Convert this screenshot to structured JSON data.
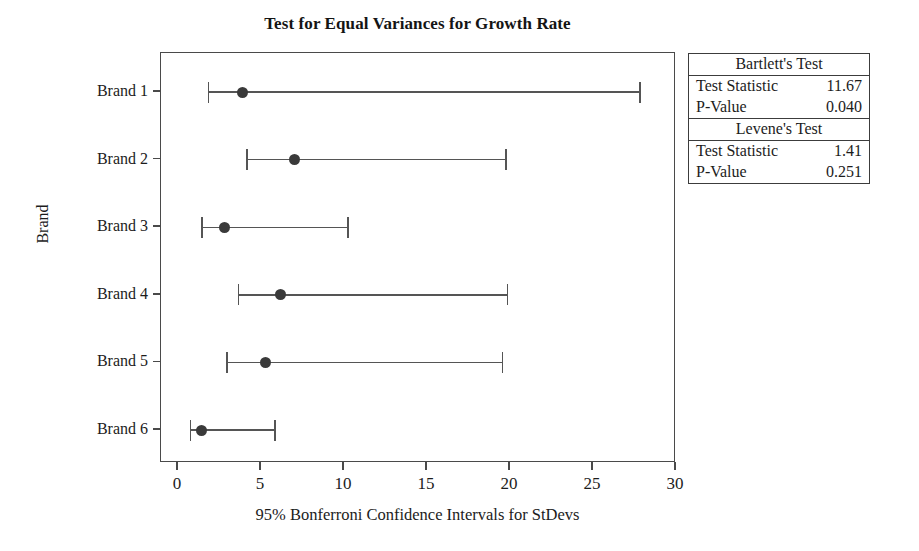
{
  "chart_data": {
    "type": "scatter",
    "title": "Test for Equal Variances for Growth Rate",
    "xlabel": "95% Bonferroni Confidence Intervals for StDevs",
    "ylabel": "Brand",
    "xlim": [
      0,
      30
    ],
    "xticks": [
      0,
      5,
      10,
      15,
      20,
      25,
      30
    ],
    "xtick_labels": [
      "0",
      "5",
      "10",
      "15",
      "20",
      "25",
      "30"
    ],
    "grid": false,
    "legend_position": "right",
    "categories": [
      "Brand 1",
      "Brand 2",
      "Brand 3",
      "Brand 4",
      "Brand 5",
      "Brand 6"
    ],
    "series": [
      {
        "name": "95% Bonferroni CI for StDev",
        "points": [
          {
            "category": "Brand 1",
            "stdev": 3.9,
            "lower": 1.8,
            "upper": 27.8
          },
          {
            "category": "Brand 2",
            "stdev": 7.0,
            "lower": 4.1,
            "upper": 19.7
          },
          {
            "category": "Brand 3",
            "stdev": 2.8,
            "lower": 1.4,
            "upper": 10.2
          },
          {
            "category": "Brand 4",
            "stdev": 6.2,
            "lower": 3.6,
            "upper": 19.8
          },
          {
            "category": "Brand 5",
            "stdev": 5.3,
            "lower": 2.9,
            "upper": 19.5
          },
          {
            "category": "Brand 6",
            "stdev": 1.4,
            "lower": 0.7,
            "upper": 5.8
          }
        ]
      }
    ],
    "annotations": {
      "bartlett_test_statistic": 11.67,
      "bartlett_p_value": 0.04,
      "levene_test_statistic": 1.41,
      "levene_p_value": 0.251
    }
  },
  "results_box": {
    "sections": [
      {
        "header": "Bartlett's Test",
        "rows": [
          {
            "label": "Test Statistic",
            "value": "11.67"
          },
          {
            "label": "P-Value",
            "value": "0.040"
          }
        ]
      },
      {
        "header": "Levene's Test",
        "rows": [
          {
            "label": "Test Statistic",
            "value": "1.41"
          },
          {
            "label": "P-Value",
            "value": "0.251"
          }
        ]
      }
    ]
  },
  "colors": {
    "axis": "#4a4a4a",
    "marker": "#3a3a3a",
    "interval": "#555555",
    "text": "#1c1c1c",
    "background": "#ffffff"
  }
}
